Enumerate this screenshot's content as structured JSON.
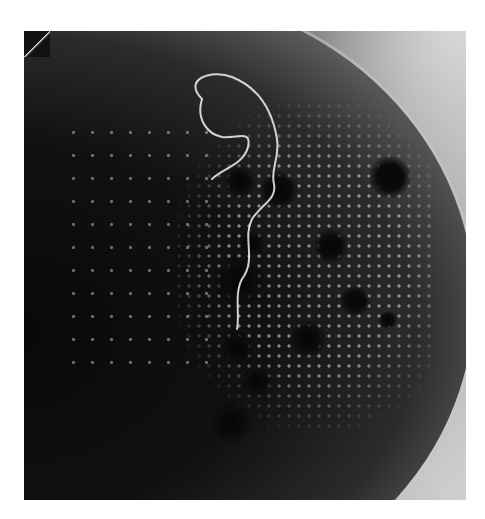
{
  "image": {
    "description": "Grayscale micrograph of a circular dish region with a lattice of bright dots, dark blotches, and a thin bright looping filament",
    "palette": {
      "background": "#ffffff",
      "dark": "#0d0d0d",
      "mid": "#6c6c6c",
      "light": "#cfcfcf"
    },
    "features": {
      "lattice_dots": "regular grid of bright points, right-center",
      "dark_spots": 12,
      "filament": "thin bright closed loop trailing downward"
    }
  }
}
